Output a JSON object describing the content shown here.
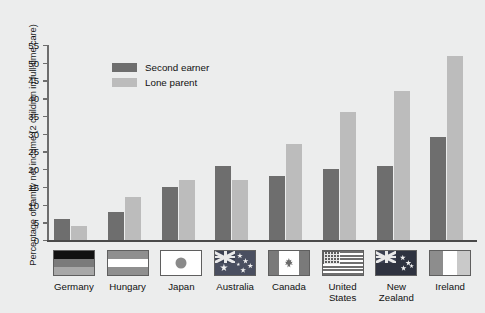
{
  "chart_data": {
    "type": "bar",
    "title": "",
    "xlabel": "",
    "ylabel": "Percentage of family net income (2 children in full-time care)",
    "ylim": [
      0,
      55
    ],
    "yticks": [
      0,
      5,
      10,
      15,
      20,
      25,
      30,
      35,
      40,
      45,
      50,
      55
    ],
    "grid": false,
    "legend_position": "inside-top-left",
    "categories": [
      "Germany",
      "Hungary",
      "Japan",
      "Australia",
      "Canada",
      "United States",
      "New Zealand",
      "Ireland"
    ],
    "series": [
      {
        "name": "Second earner",
        "color": "#6e6e6e",
        "values": [
          6,
          8,
          15,
          21,
          18,
          20,
          21,
          29
        ]
      },
      {
        "name": "Lone parent",
        "color": "#bcbcbc",
        "values": [
          4,
          12,
          17,
          17,
          27,
          36,
          42,
          52
        ]
      }
    ],
    "flags": [
      {
        "country": "Germany",
        "icon": "flag-germany"
      },
      {
        "country": "Hungary",
        "icon": "flag-hungary"
      },
      {
        "country": "Japan",
        "icon": "flag-japan"
      },
      {
        "country": "Australia",
        "icon": "flag-australia"
      },
      {
        "country": "Canada",
        "icon": "flag-canada"
      },
      {
        "country": "United States",
        "icon": "flag-united-states"
      },
      {
        "country": "New Zealand",
        "icon": "flag-new-zealand"
      },
      {
        "country": "Ireland",
        "icon": "flag-ireland"
      }
    ],
    "category_label_lines": [
      [
        "Germany"
      ],
      [
        "Hungary"
      ],
      [
        "Japan"
      ],
      [
        "Australia"
      ],
      [
        "Canada"
      ],
      [
        "United",
        "States"
      ],
      [
        "New",
        "Zealand"
      ],
      [
        "Ireland"
      ]
    ]
  },
  "colors": {
    "background": "#eceded",
    "axis": "#4a4a4a",
    "text": "#111111",
    "second_earner": "#6e6e6e",
    "lone_parent": "#bcbcbc"
  }
}
